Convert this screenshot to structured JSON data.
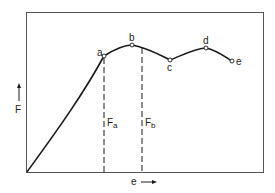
{
  "diagram": {
    "type": "load-elongation curve",
    "y_axis_label": "F",
    "x_axis_label": "e",
    "points": [
      {
        "id": "a",
        "label": "a"
      },
      {
        "id": "b",
        "label": "b"
      },
      {
        "id": "c",
        "label": "c"
      },
      {
        "id": "d",
        "label": "d"
      },
      {
        "id": "e",
        "label": "e"
      }
    ],
    "dashed_lines": [
      {
        "label": "F",
        "subscript": "a"
      },
      {
        "label": "F",
        "subscript": "b"
      }
    ],
    "colors": {
      "line": "#1a1a1a",
      "frame": "#555555",
      "background": "#ffffff"
    }
  }
}
